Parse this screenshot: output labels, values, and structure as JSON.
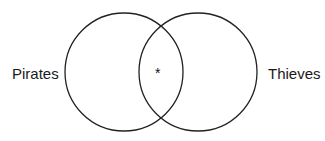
{
  "diagram": {
    "type": "venn",
    "sets": [
      {
        "label": "Pirates",
        "cx": 124,
        "cy": 72,
        "r": 59
      },
      {
        "label": "Thieves",
        "cx": 198,
        "cy": 72,
        "r": 59
      }
    ],
    "intersection_marker": "*",
    "stroke_color": "#222222"
  }
}
